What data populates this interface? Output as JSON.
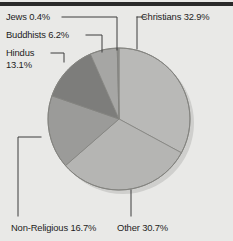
{
  "chart_data": {
    "type": "pie",
    "title": "",
    "xlabel": "",
    "ylabel": "",
    "legend_position": "callout-labels",
    "grid": false,
    "categories": [
      "Christians",
      "Other",
      "Non-Religious",
      "Hindus",
      "Buddhists",
      "Jews"
    ],
    "values": [
      32.9,
      30.7,
      16.7,
      13.1,
      6.2,
      0.4
    ],
    "unit": "%",
    "slices": [
      {
        "id": "christians",
        "label": "Christians",
        "value": 32.9,
        "label_text": "Christians 32.9%",
        "color": "#b9b9b7"
      },
      {
        "id": "other",
        "label": "Other",
        "value": 30.7,
        "label_text": "Other 30.7%",
        "color": "#b5b5b3"
      },
      {
        "id": "non-religious",
        "label": "Non-Religious",
        "value": 16.7,
        "label_text": "Non-Religious 16.7%",
        "color": "#9b9b99"
      },
      {
        "id": "hindus",
        "label": "Hindus",
        "value": 13.1,
        "label_text": "Hindus\n13.1%",
        "color": "#7d7d7b"
      },
      {
        "id": "buddhists",
        "label": "Buddhists",
        "value": 6.2,
        "label_text": "Buddhists 6.2%",
        "color": "#a6a6a4"
      },
      {
        "id": "jews",
        "label": "Jews",
        "value": 0.4,
        "label_text": "Jews 0.4%",
        "color": "#8e8e8c"
      }
    ],
    "colors": {
      "background": "#e9e9e7",
      "rule": "#2a2a2a",
      "text": "#1d1d1d",
      "leader": "#3c3c3c",
      "outline": "#6e6e6c"
    },
    "geometry": {
      "cx": 119,
      "cy": 119,
      "r": 71,
      "start_angle_deg": -90
    }
  }
}
